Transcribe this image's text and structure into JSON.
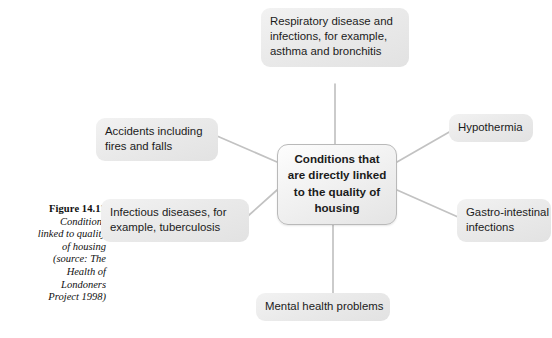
{
  "figure": {
    "caption_title": "Figure 14.12",
    "caption_lines": [
      "Conditions",
      "linked to quality",
      "of housing",
      "(source: The",
      "Health of",
      "Londoners",
      "Project 1998)"
    ]
  },
  "diagram": {
    "type": "radial-spider",
    "center": {
      "id": "center",
      "lines": [
        "Conditions that",
        "are directly linked",
        "to the quality of",
        "housing"
      ]
    },
    "nodes": [
      {
        "id": "respiratory",
        "lines": [
          "Respiratory disease and",
          "infections, for example,",
          "asthma and bronchitis"
        ]
      },
      {
        "id": "hypothermia",
        "lines": [
          "Hypothermia"
        ]
      },
      {
        "id": "gastro",
        "lines": [
          "Gastro-intestinal",
          "infections"
        ]
      },
      {
        "id": "mental",
        "lines": [
          "Mental health problems"
        ]
      },
      {
        "id": "infectious",
        "lines": [
          "Infectious diseases, for",
          "example, tuberculosis"
        ]
      },
      {
        "id": "accidents",
        "lines": [
          "Accidents including",
          "fires and falls"
        ]
      }
    ],
    "connectors": [
      {
        "from": "center",
        "to": "respiratory",
        "x1": 335,
        "y1": 144,
        "x2": 335,
        "y2": 84
      },
      {
        "from": "center",
        "to": "hypothermia",
        "x1": 397,
        "y1": 162,
        "x2": 449,
        "y2": 132
      },
      {
        "from": "center",
        "to": "gastro",
        "x1": 397,
        "y1": 190,
        "x2": 457,
        "y2": 216
      },
      {
        "from": "center",
        "to": "mental",
        "x1": 333,
        "y1": 223,
        "x2": 333,
        "y2": 293
      },
      {
        "from": "center",
        "to": "infectious",
        "x1": 277,
        "y1": 190,
        "x2": 249,
        "y2": 216
      },
      {
        "from": "center",
        "to": "accidents",
        "x1": 277,
        "y1": 162,
        "x2": 218,
        "y2": 137
      }
    ],
    "colors": {
      "node_fill": "#ebebeb",
      "center_border": "#b9b9b9",
      "connector": "#c2c2c2",
      "text": "#1b1b1b",
      "background": "#ffffff"
    }
  }
}
